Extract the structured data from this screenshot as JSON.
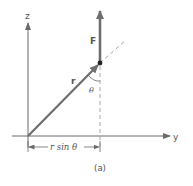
{
  "diagram": {
    "labels": {
      "z_axis": "z",
      "y_axis": "y",
      "force": "F",
      "radius": "r",
      "angle": "θ",
      "dimension": "r sin θ",
      "caption": "(a)"
    },
    "colors": {
      "axis": "#6a6a6a",
      "vector": "#6e6e6e",
      "dashed": "#a8a8a8",
      "point": "#222222",
      "text": "#555555"
    }
  }
}
